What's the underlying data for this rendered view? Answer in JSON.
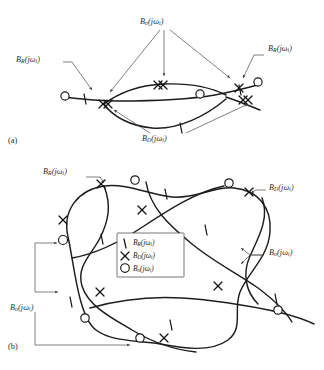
{
  "figure": {
    "caption_panels": [
      "(a)",
      "(b)"
    ],
    "symbols": {
      "tick": "tick-mark",
      "cross": "x-mark",
      "circle": "circle-mark"
    }
  },
  "labels": {
    "B_R": {
      "base": "B",
      "sub": "R",
      "arg": "(jω",
      "argsub": "i",
      "argend": ")"
    },
    "B_D": {
      "base": "B",
      "sub": "D",
      "arg": "(jω",
      "argsub": "i",
      "argend": ")"
    },
    "B_o": {
      "base": "B",
      "sub": "o",
      "arg": "(jω",
      "argsub": "i",
      "argend": ")"
    }
  },
  "panel_a": {
    "label": "(a)",
    "annotations": [
      {
        "name": "left-BR",
        "text_base": "B",
        "text_sub": "R",
        "text_tail": "(jω",
        "text_tail_sub": "i",
        "text_end": ")"
      },
      {
        "name": "top-Bo",
        "text_base": "B",
        "text_sub": "o",
        "text_tail": "(jω",
        "text_tail_sub": "i",
        "text_end": ")"
      },
      {
        "name": "right-BR",
        "text_base": "B",
        "text_sub": "R",
        "text_tail": "(jω",
        "text_tail_sub": "i",
        "text_end": ")"
      },
      {
        "name": "bottom-BD",
        "text_base": "B",
        "text_sub": "D",
        "text_tail": "(jω",
        "text_tail_sub": "i",
        "text_end": ")"
      }
    ]
  },
  "panel_b": {
    "label": "(b)",
    "annotations": [
      {
        "name": "topleft-BR",
        "text_base": "B",
        "text_sub": "R",
        "text_tail": "(jω",
        "text_tail_sub": "i",
        "text_end": ")"
      },
      {
        "name": "topright-BD",
        "text_base": "B",
        "text_sub": "D",
        "text_tail": "(jω",
        "text_tail_sub": "i",
        "text_end": ")"
      },
      {
        "name": "right-Bo",
        "text_base": "B",
        "text_sub": "o",
        "text_tail": "(jω",
        "text_tail_sub": "i",
        "text_end": ")"
      },
      {
        "name": "left-Bo",
        "text_base": "B",
        "text_sub": "o",
        "text_tail": "(jω",
        "text_tail_sub": "i",
        "text_end": ")"
      }
    ]
  },
  "legend": {
    "entries": [
      {
        "symbol": "tick-mark",
        "base": "B",
        "sub": "R",
        "tail": "(jω",
        "tailsub": "i",
        "end": ")"
      },
      {
        "symbol": "x-mark",
        "base": "B",
        "sub": "D",
        "tail": "(jω",
        "tailsub": "i",
        "end": ")"
      },
      {
        "symbol": "circle-mark",
        "base": "B",
        "sub": "o",
        "tail": "(jω",
        "tailsub": "i",
        "end": ")"
      }
    ]
  },
  "colors": {
    "ink": "#1d1d1d",
    "leader": "#4a4a4a",
    "background": "#ffffff"
  }
}
